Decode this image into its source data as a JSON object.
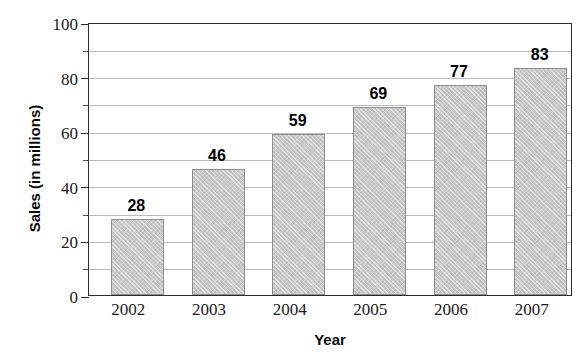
{
  "chart_data": {
    "type": "bar",
    "title_visible": false,
    "xlabel": "Year",
    "ylabel": "Sales (in millions)",
    "categories": [
      "2002",
      "2003",
      "2004",
      "2005",
      "2006",
      "2007"
    ],
    "values": [
      28,
      46,
      59,
      69,
      77,
      83
    ],
    "value_labels": [
      "28",
      "46",
      "59",
      "69",
      "77",
      "83"
    ],
    "ylim": [
      0,
      100
    ],
    "ytick_labels": [
      "0",
      "20",
      "40",
      "60",
      "80",
      "100"
    ],
    "ytick_values": [
      0,
      20,
      40,
      60,
      80,
      100
    ],
    "gridline_values": [
      10,
      20,
      30,
      40,
      50,
      60,
      70,
      80,
      90
    ],
    "grid": true,
    "legend": null,
    "series": [
      {
        "name": "Sales",
        "values": [
          28,
          46,
          59,
          69,
          77,
          83
        ]
      }
    ],
    "colors": {
      "bar_fill": "#c9c9c9",
      "bar_border": "#8e8e8e",
      "gridline": "#b9b9b9",
      "axis": "#2b2b2b",
      "text": "#0b0b0b",
      "background": "#ffffff"
    }
  }
}
